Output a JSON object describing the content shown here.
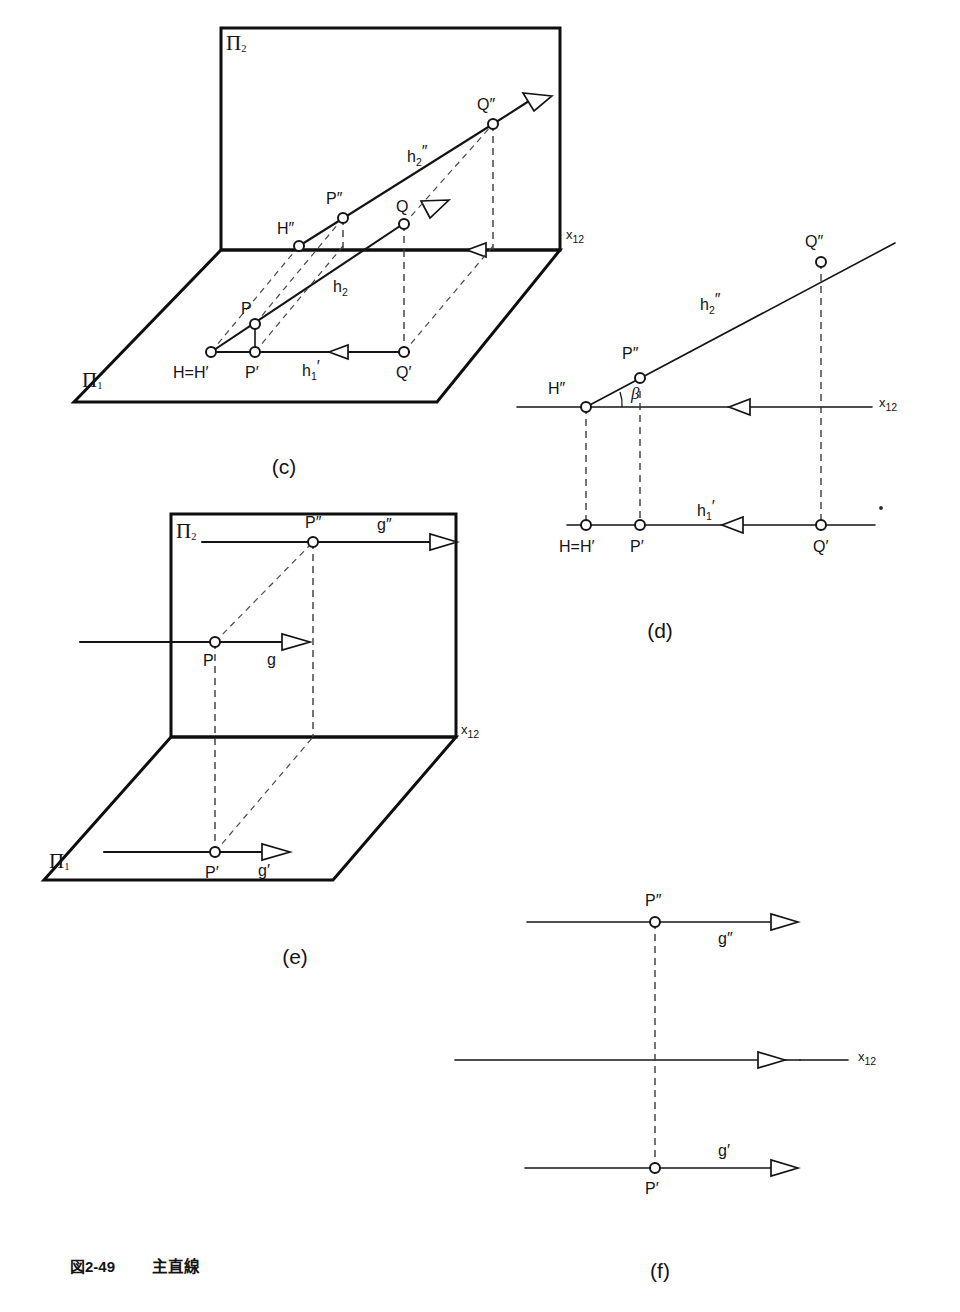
{
  "figure": {
    "caption_number": "図2-49",
    "caption_title": "主直線",
    "background_color": "#ffffff",
    "ink_color": "#141414"
  },
  "panels": [
    {
      "id": "c",
      "label": "(c)",
      "kind": "pictorial-3d",
      "planes": {
        "vertical": "Π₂",
        "horizontal": "Π₁"
      },
      "ground_line_label": "x₁₂",
      "points": [
        "H″",
        "P″",
        "Q″",
        "P",
        "Q",
        "H=H′",
        "P′",
        "Q′"
      ],
      "lines": [
        "h₂″",
        "h₂",
        "h₁′"
      ],
      "point_labels": {
        "H2": "H",
        "H2_prime": "″",
        "P2": "P",
        "P2_prime": "″",
        "Q2": "Q",
        "Q2_prime": "″",
        "P_space": "P",
        "Q_space": "Q",
        "H_eq_H1": "H=H′",
        "P1": "P′",
        "Q1": "Q′"
      },
      "line_labels": {
        "h2_dd": "h",
        "h2_dd_sub": "2",
        "h2_dd_prime": "″",
        "h2_d": "h",
        "h2_d_sub": "2",
        "h1_d": "h",
        "h1_d_sub": "1",
        "h1_d_prime": "′"
      }
    },
    {
      "id": "d",
      "label": "(d)",
      "kind": "orthographic-projection",
      "ground_line_label": "x₁₂",
      "angle_label": "β",
      "points": [
        "H″",
        "P″",
        "Q″",
        "H=H′",
        "P′",
        "Q′"
      ],
      "lines": [
        "h₂″",
        "h₁′"
      ],
      "point_labels": {
        "H2": "H″",
        "P2": "P″",
        "Q2": "Q″",
        "H_eq_H1": "H=H′",
        "P1": "P′",
        "Q1": "Q′"
      },
      "line_labels": {
        "h2_dd": "h",
        "h2_dd_sub": "2",
        "h2_dd_prime": "″",
        "h1_d": "h",
        "h1_d_sub": "1",
        "h1_d_prime": "′"
      }
    },
    {
      "id": "e",
      "label": "(e)",
      "kind": "pictorial-3d",
      "planes": {
        "vertical": "Π₂",
        "horizontal": "Π₁"
      },
      "ground_line_label": "x₁₂",
      "points": [
        "P″",
        "P",
        "P′"
      ],
      "lines": [
        "g″",
        "g",
        "g′"
      ],
      "point_labels": {
        "P2": "P″",
        "P_space": "P",
        "P1": "P′"
      },
      "line_labels": {
        "g_dd": "g″",
        "g": "g",
        "g_d": "g′"
      }
    },
    {
      "id": "f",
      "label": "(f)",
      "kind": "orthographic-projection",
      "ground_line_label": "x₁₂",
      "points": [
        "P″",
        "P′"
      ],
      "lines": [
        "g″",
        "g′"
      ],
      "point_labels": {
        "P2": "P″",
        "P1": "P′"
      },
      "line_labels": {
        "g_dd": "g″",
        "g_d": "g′"
      }
    }
  ],
  "glyphs": {
    "pi": "Π",
    "sub1": "1",
    "sub2": "2",
    "x": "x",
    "sub12": "12",
    "prime_single": "′",
    "prime_double": "″",
    "beta": "β"
  }
}
